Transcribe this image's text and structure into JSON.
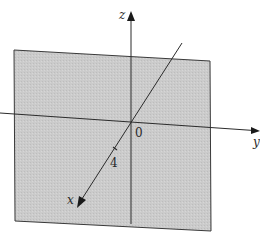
{
  "figure": {
    "plane_color": "#c9c9c9",
    "line_color": "#2b2b2b",
    "axes": {
      "x": {
        "label": "x"
      },
      "y": {
        "label": "y"
      },
      "z": {
        "label": "z"
      }
    },
    "labels": {
      "origin": "0",
      "x_intercept": "4"
    }
  }
}
